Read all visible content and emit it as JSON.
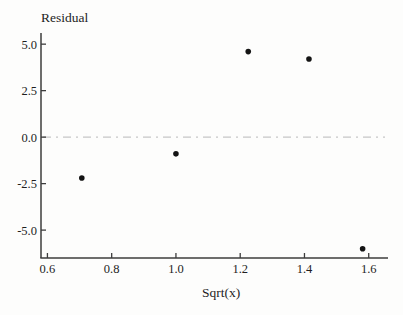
{
  "chart": {
    "y_axis_title": "Residual",
    "x_axis_title": "Sqrt(x)"
  },
  "chart_data": {
    "type": "scatter",
    "title": "Residual",
    "xlabel": "Sqrt(x)",
    "ylabel": "Residual",
    "points": [
      {
        "x": 0.707,
        "y": -2.2
      },
      {
        "x": 1.0,
        "y": -0.9
      },
      {
        "x": 1.225,
        "y": 4.6
      },
      {
        "x": 1.414,
        "y": 4.2
      },
      {
        "x": 1.581,
        "y": -6.0
      }
    ],
    "x_ticks": [
      {
        "value": 0.6,
        "label": "0.6"
      },
      {
        "value": 0.8,
        "label": "0.8"
      },
      {
        "value": 1.0,
        "label": "1.0"
      },
      {
        "value": 1.2,
        "label": "1.2"
      },
      {
        "value": 1.4,
        "label": "1.4"
      },
      {
        "value": 1.6,
        "label": "1.6"
      }
    ],
    "y_ticks": [
      {
        "value": 5.0,
        "label": "5.0"
      },
      {
        "value": 2.5,
        "label": "2.5"
      },
      {
        "value": 0.0,
        "label": "0.0"
      },
      {
        "value": -2.5,
        "label": "-2.5"
      },
      {
        "value": -5.0,
        "label": "-5.0"
      }
    ],
    "xlim": [
      0.58,
      1.66
    ],
    "ylim": [
      -6.5,
      5.6
    ],
    "zero_line": {
      "y": 0.0,
      "style": "dash-dot"
    },
    "grid": false,
    "legend": false,
    "colors": {
      "point": "#141414",
      "axis": "#3d3d3d",
      "text": "#1e1e1e",
      "zero_line": "#c6c6c6",
      "background": "#fdfdfc"
    }
  }
}
